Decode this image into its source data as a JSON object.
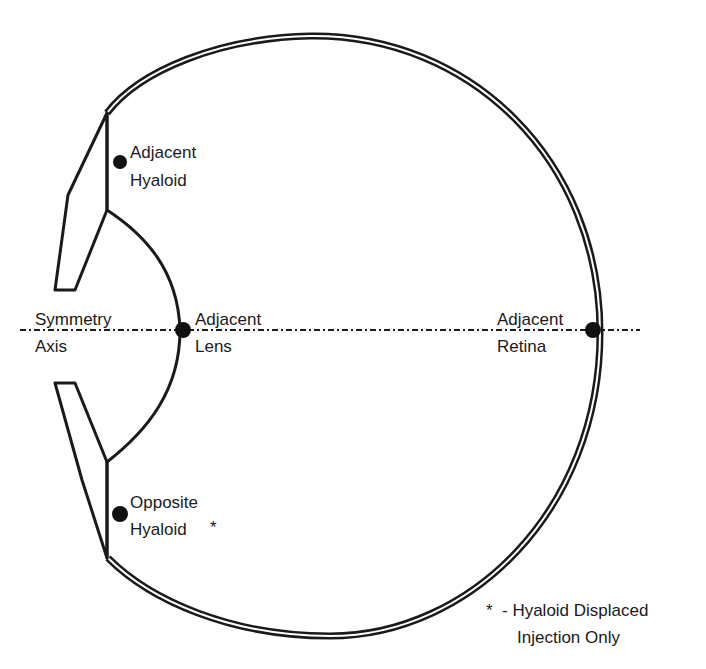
{
  "diagram": {
    "labels": {
      "adjacent_hyaloid": [
        "Adjacent",
        "Hyaloid"
      ],
      "symmetry_axis": [
        "Symmetry",
        "Axis"
      ],
      "adjacent_lens": [
        "Adjacent",
        "Lens"
      ],
      "adjacent_retina": [
        "Adjacent",
        "Retina"
      ],
      "opposite_hyaloid": [
        "Opposite",
        "Hyaloid"
      ],
      "opposite_hyaloid_marker": "*"
    },
    "footnote": {
      "marker": "*",
      "line1": "- Hyaloid Displaced",
      "line2": "Injection Only"
    },
    "sites": [
      {
        "name": "Adjacent Hyaloid"
      },
      {
        "name": "Adjacent Lens"
      },
      {
        "name": "Adjacent Retina"
      },
      {
        "name": "Opposite Hyaloid",
        "note": "*"
      }
    ],
    "colors": {
      "line": "#1a1a1a",
      "background": "#ffffff"
    }
  }
}
